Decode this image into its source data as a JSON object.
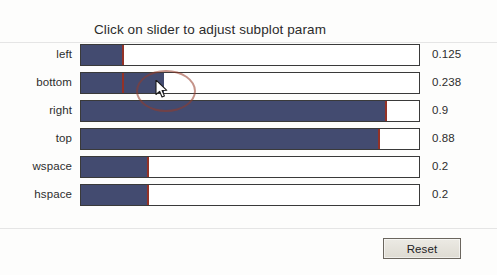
{
  "window": {
    "title": "Click on slider to adjust subplot param",
    "background_color": "#fdfdfc"
  },
  "colors": {
    "slider_fill": "#434b70",
    "slider_marker": "#9a3021",
    "track_border": "#3a3a3a",
    "text": "#2d2d2d",
    "button_face": "#e5e2da",
    "highlight_ring": "#963a28"
  },
  "sliders": [
    {
      "label": "left",
      "value": "0.125",
      "fill_fraction": 0.125,
      "marker_fraction": 0.125
    },
    {
      "label": "bottom",
      "value": "0.238",
      "fill_fraction": 0.244,
      "marker_fraction": 0.125
    },
    {
      "label": "right",
      "value": "0.9",
      "fill_fraction": 0.9,
      "marker_fraction": 0.9
    },
    {
      "label": "top",
      "value": "0.88",
      "fill_fraction": 0.88,
      "marker_fraction": 0.88
    },
    {
      "label": "wspace",
      "value": "0.2",
      "fill_fraction": 0.2,
      "marker_fraction": 0.2
    },
    {
      "label": "hspace",
      "value": "0.2",
      "fill_fraction": 0.2,
      "marker_fraction": 0.2
    }
  ],
  "buttons": {
    "reset_label": "Reset"
  },
  "pointer": {
    "icon": "arrow-cursor-icon",
    "x": 155,
    "y": 80,
    "highlight_icon": "click-highlight-ellipse"
  }
}
